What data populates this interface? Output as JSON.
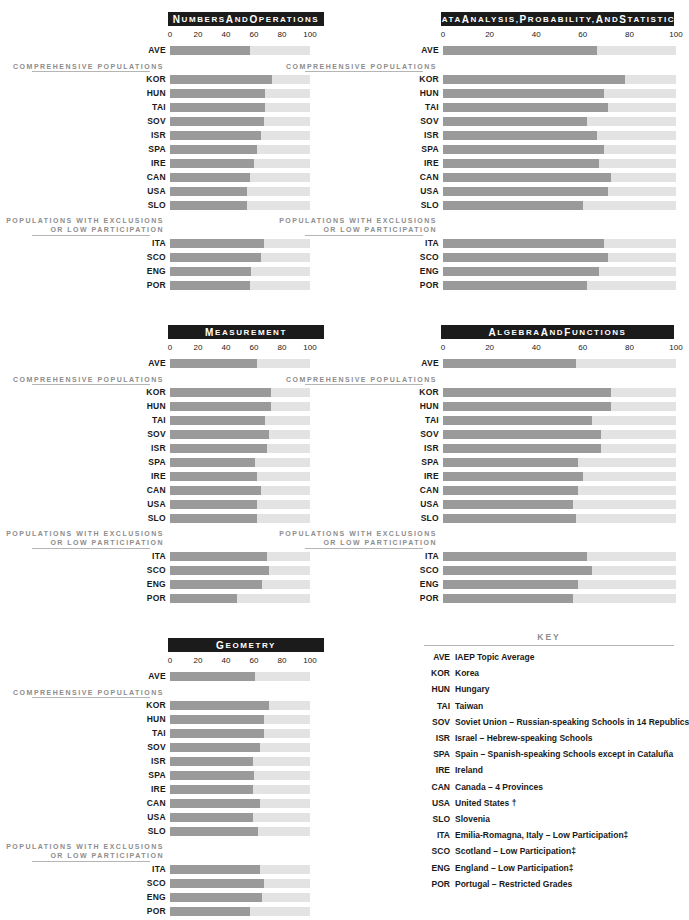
{
  "meta": {
    "group_labels": {
      "comprehensive": "COMPREHENSIVE POPULATIONS",
      "exclusions_line1": "POPULATIONS WITH EXCLUSIONS",
      "exclusions_line2": "OR LOW PARTICIPATION"
    },
    "colors": {
      "bar_fill": "#9a9a9a",
      "bar_track": "#e3e3e3",
      "header_bg": "#1b1b1b",
      "header_text": "#ffffff",
      "group_label": "#8d8d8d",
      "rule": "#b5b5b5",
      "text": "#1a1a1a"
    }
  },
  "key": {
    "title": "KEY",
    "entries": [
      {
        "code": "AVE",
        "desc": "IAEP Topic Average"
      },
      {
        "code": "KOR",
        "desc": "Korea"
      },
      {
        "code": "HUN",
        "desc": "Hungary"
      },
      {
        "code": "TAI",
        "desc": "Taiwan"
      },
      {
        "code": "SOV",
        "desc": "Soviet Union – Russian-speaking Schools in 14 Republics"
      },
      {
        "code": "ISR",
        "desc": "Israel – Hebrew-speaking Schools"
      },
      {
        "code": "SPA",
        "desc": "Spain – Spanish-speaking Schools except in Cataluña"
      },
      {
        "code": "IRE",
        "desc": "Ireland"
      },
      {
        "code": "CAN",
        "desc": "Canada – 4 Provinces"
      },
      {
        "code": "USA",
        "desc": "United States †"
      },
      {
        "code": "SLO",
        "desc": "Slovenia"
      },
      {
        "code": "ITA",
        "desc": "Emilia-Romagna, Italy – Low Participation‡"
      },
      {
        "code": "SCO",
        "desc": "Scotland – Low Participation‡"
      },
      {
        "code": "ENG",
        "desc": "England – Low Participation‡"
      },
      {
        "code": "POR",
        "desc": "Portugal – Restricted Grades"
      }
    ]
  },
  "chart_data": [
    {
      "id": "numbers-and-operations",
      "type": "bar",
      "orientation": "horizontal",
      "title": "Numbers and Operations",
      "xlabel": "",
      "ylabel": "",
      "xlim": [
        0,
        100
      ],
      "ticks": [
        0,
        20,
        40,
        60,
        80,
        100
      ],
      "tick_labels": [
        "0",
        "20",
        "40",
        "60",
        "80",
        "100"
      ],
      "grid": false,
      "average": {
        "code": "AVE",
        "value": 57
      },
      "groups": [
        {
          "name": "COMPREHENSIVE POPULATIONS",
          "categories": [
            "KOR",
            "HUN",
            "TAI",
            "SOV",
            "ISR",
            "SPA",
            "IRE",
            "CAN",
            "USA",
            "SLO"
          ],
          "values": [
            73,
            68,
            68,
            67,
            65,
            62,
            60,
            57,
            55,
            55
          ]
        },
        {
          "name": "POPULATIONS WITH EXCLUSIONS OR LOW PARTICIPATION",
          "categories": [
            "ITA",
            "SCO",
            "ENG",
            "POR"
          ],
          "values": [
            67,
            65,
            58,
            57
          ]
        }
      ]
    },
    {
      "id": "data-analysis-probability-and-statistics",
      "type": "bar",
      "orientation": "horizontal",
      "title": "Data Analysis, Probability, and Statistics",
      "xlabel": "",
      "ylabel": "",
      "xlim": [
        0,
        100
      ],
      "ticks": [
        0,
        20,
        40,
        60,
        80,
        100
      ],
      "tick_labels": [
        "0",
        "20",
        "40",
        "60",
        "80",
        "100"
      ],
      "grid": false,
      "average": {
        "code": "AVE",
        "value": 66
      },
      "groups": [
        {
          "name": "COMPREHENSIVE POPULATIONS",
          "categories": [
            "KOR",
            "HUN",
            "TAI",
            "SOV",
            "ISR",
            "SPA",
            "IRE",
            "CAN",
            "USA",
            "SLO"
          ],
          "values": [
            78,
            69,
            71,
            62,
            66,
            69,
            67,
            72,
            71,
            60
          ]
        },
        {
          "name": "POPULATIONS WITH EXCLUSIONS OR LOW PARTICIPATION",
          "categories": [
            "ITA",
            "SCO",
            "ENG",
            "POR"
          ],
          "values": [
            69,
            71,
            67,
            62
          ]
        }
      ]
    },
    {
      "id": "measurement",
      "type": "bar",
      "orientation": "horizontal",
      "title": "Measurement",
      "xlabel": "",
      "ylabel": "",
      "xlim": [
        0,
        100
      ],
      "ticks": [
        0,
        20,
        40,
        60,
        80,
        100
      ],
      "tick_labels": [
        "0",
        "20",
        "40",
        "60",
        "80",
        "100"
      ],
      "grid": false,
      "average": {
        "code": "AVE",
        "value": 62
      },
      "groups": [
        {
          "name": "COMPREHENSIVE POPULATIONS",
          "categories": [
            "KOR",
            "HUN",
            "TAI",
            "SOV",
            "ISR",
            "SPA",
            "IRE",
            "CAN",
            "USA",
            "SLO"
          ],
          "values": [
            72,
            72,
            68,
            71,
            69,
            61,
            62,
            65,
            62,
            62
          ]
        },
        {
          "name": "POPULATIONS WITH EXCLUSIONS OR LOW PARTICIPATION",
          "categories": [
            "ITA",
            "SCO",
            "ENG",
            "POR"
          ],
          "values": [
            69,
            71,
            66,
            48
          ]
        }
      ]
    },
    {
      "id": "algebra-and-functions",
      "type": "bar",
      "orientation": "horizontal",
      "title": "Algebra and Functions",
      "xlabel": "",
      "ylabel": "",
      "xlim": [
        0,
        100
      ],
      "ticks": [
        0,
        20,
        40,
        60,
        80,
        100
      ],
      "tick_labels": [
        "0",
        "20",
        "40",
        "60",
        "80",
        "100"
      ],
      "grid": false,
      "average": {
        "code": "AVE",
        "value": 57
      },
      "groups": [
        {
          "name": "COMPREHENSIVE POPULATIONS",
          "categories": [
            "KOR",
            "HUN",
            "TAI",
            "SOV",
            "ISR",
            "SPA",
            "IRE",
            "CAN",
            "USA",
            "SLO"
          ],
          "values": [
            72,
            72,
            64,
            68,
            68,
            58,
            60,
            58,
            56,
            57
          ]
        },
        {
          "name": "POPULATIONS WITH EXCLUSIONS OR LOW PARTICIPATION",
          "categories": [
            "ITA",
            "SCO",
            "ENG",
            "POR"
          ],
          "values": [
            62,
            64,
            58,
            56
          ]
        }
      ]
    },
    {
      "id": "geometry",
      "type": "bar",
      "orientation": "horizontal",
      "title": "Geometry",
      "xlabel": "",
      "ylabel": "",
      "xlim": [
        0,
        100
      ],
      "ticks": [
        0,
        20,
        40,
        60,
        80,
        100
      ],
      "tick_labels": [
        "0",
        "20",
        "40",
        "60",
        "80",
        "100"
      ],
      "grid": false,
      "average": {
        "code": "AVE",
        "value": 61
      },
      "groups": [
        {
          "name": "COMPREHENSIVE POPULATIONS",
          "categories": [
            "KOR",
            "HUN",
            "TAI",
            "SOV",
            "ISR",
            "SPA",
            "IRE",
            "CAN",
            "USA",
            "SLO"
          ],
          "values": [
            71,
            67,
            67,
            64,
            59,
            60,
            59,
            64,
            59,
            63
          ]
        },
        {
          "name": "POPULATIONS WITH EXCLUSIONS OR LOW PARTICIPATION",
          "categories": [
            "ITA",
            "SCO",
            "ENG",
            "POR"
          ],
          "values": [
            64,
            67,
            66,
            57
          ]
        }
      ]
    }
  ]
}
